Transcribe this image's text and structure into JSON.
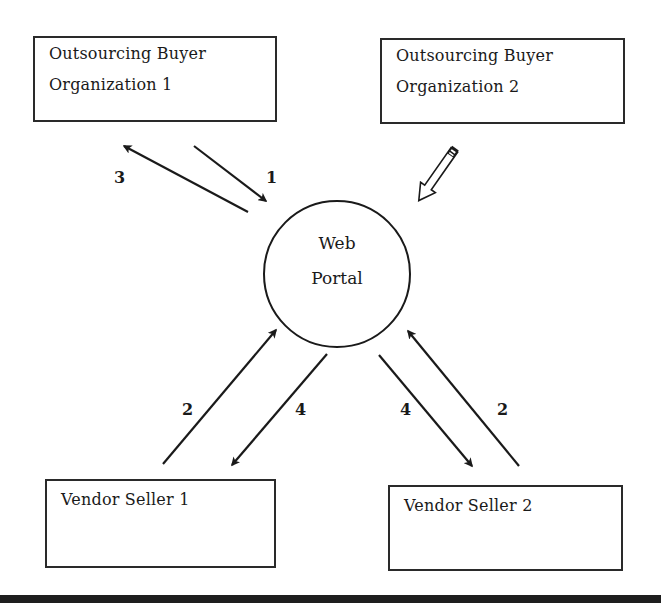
{
  "diagram": {
    "nodes": {
      "buyer1": {
        "line1": "Outsourcing  Buyer",
        "line2": "Organization 1"
      },
      "buyer2": {
        "line1": "Outsourcing  Buyer",
        "line2": "Organization 2"
      },
      "portal": {
        "line1": "Web",
        "line2": "Portal"
      },
      "seller1": {
        "line1": "Vendor Seller 1"
      },
      "seller2": {
        "line1": "Vendor Seller 2"
      }
    },
    "edges": [
      {
        "id": "e1",
        "from": "Outsourcing Buyer Organization 1",
        "to": "Web Portal",
        "label": "1"
      },
      {
        "id": "e3",
        "from": "Web Portal",
        "to": "Outsourcing Buyer Organization 1",
        "label": "3"
      },
      {
        "id": "e2a",
        "from": "Vendor Seller 1",
        "to": "Web Portal",
        "label": "2"
      },
      {
        "id": "e4a",
        "from": "Web Portal",
        "to": "Vendor Seller 1",
        "label": "4"
      },
      {
        "id": "e4b",
        "from": "Web Portal",
        "to": "Vendor Seller 2",
        "label": "4"
      },
      {
        "id": "e2b",
        "from": "Vendor Seller 2",
        "to": "Web Portal",
        "label": "2"
      },
      {
        "id": "pencil",
        "from": "Outsourcing Buyer Organization 2",
        "to": "Web Portal",
        "label": "",
        "icon": "pencil-icon"
      }
    ],
    "labels": {
      "l3": "3",
      "l1": "1",
      "l2_left": "2",
      "l4_left": "4",
      "l4_right": "4",
      "l2_right": "2"
    },
    "colors": {
      "stroke": "#1a1a1a",
      "background": "#ffffff",
      "rule": "#1e1e1e"
    }
  }
}
